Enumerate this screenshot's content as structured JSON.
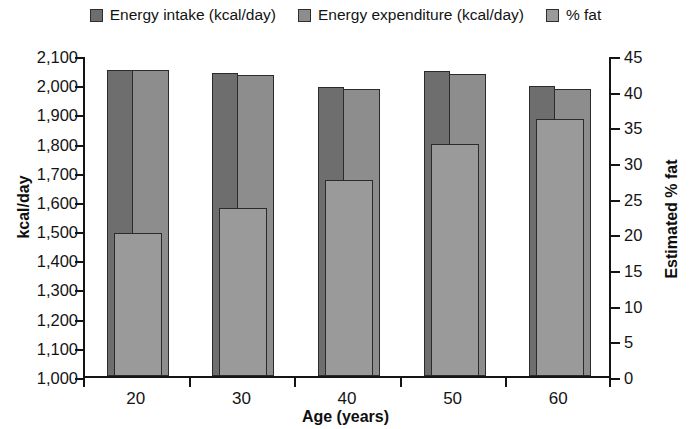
{
  "chart_data": {
    "type": "bar",
    "title": "",
    "subtitle": "",
    "xlabel": "Age (years)",
    "ylabel": "kcal/day",
    "y2label": "Estimated % fat",
    "categories": [
      "20",
      "30",
      "40",
      "50",
      "60"
    ],
    "x": [
      20,
      30,
      40,
      50,
      60
    ],
    "ylim": [
      1000,
      2100
    ],
    "y2lim": [
      0,
      45
    ],
    "yticks": [
      "1,000",
      "1,100",
      "1,200",
      "1,300",
      "1,400",
      "1,500",
      "1,600",
      "1,700",
      "1,800",
      "1,900",
      "2,000",
      "2,100"
    ],
    "ytick_values": [
      1000,
      1100,
      1200,
      1300,
      1400,
      1500,
      1600,
      1700,
      1800,
      1900,
      2000,
      2100
    ],
    "y2ticks": [
      "0",
      "5",
      "10",
      "15",
      "20",
      "25",
      "30",
      "35",
      "40",
      "45"
    ],
    "y2tick_values": [
      0,
      5,
      10,
      15,
      20,
      25,
      30,
      35,
      40,
      45
    ],
    "grid": false,
    "legend_position": "top",
    "series": [
      {
        "name": "Energy intake (kcal/day)",
        "axis": "left",
        "color": "#6e6e6e",
        "values": [
          2050,
          2040,
          1990,
          2045,
          1995
        ]
      },
      {
        "name": "Energy expenditure (kcal/day)",
        "axis": "left",
        "color": "#8d8d8d",
        "values": [
          2050,
          2030,
          1985,
          2035,
          1985
        ]
      },
      {
        "name": "% fat",
        "axis": "right",
        "color": "#9a9a9a",
        "values": [
          20.0,
          23.5,
          27.5,
          32.5,
          36.0
        ]
      }
    ]
  },
  "legend": {
    "items": [
      {
        "label": "Energy intake (kcal/day)",
        "color": "#6e6e6e"
      },
      {
        "label": "Energy expenditure (kcal/day)",
        "color": "#8d8d8d"
      },
      {
        "label": "% fat",
        "color": "#9a9a9a"
      }
    ]
  },
  "colors": {
    "axis": "#141414",
    "background": "#ffffff",
    "bar_border": "#2b2b2b"
  }
}
